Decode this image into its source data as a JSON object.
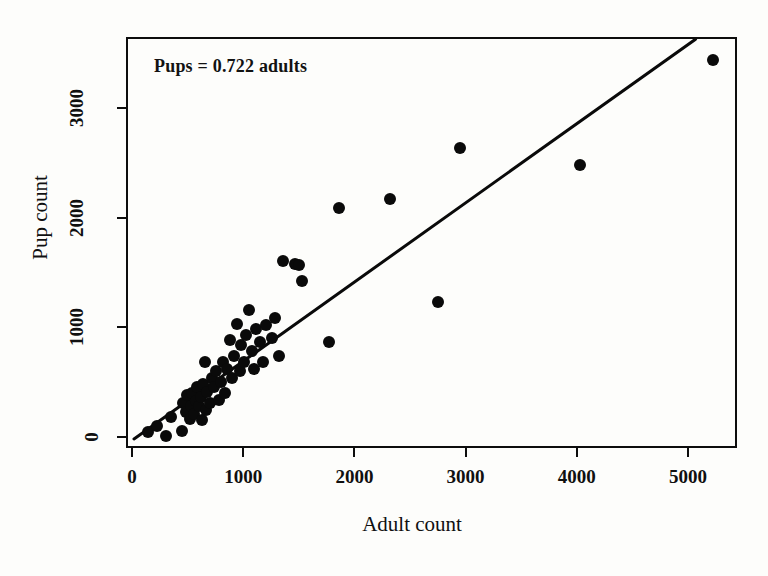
{
  "figure": {
    "background_color": "#fdfdfb",
    "foreground_color": "#0a0a0a"
  },
  "annotation": {
    "equation_text": "Pups = 0.722 adults"
  },
  "axis_titles": {
    "x": "Adult count",
    "y": "Pup count"
  },
  "chart_data": {
    "type": "scatter",
    "title": "",
    "subtitle": "",
    "xlabel": "Adult count",
    "ylabel": "Pup count",
    "xlim": [
      -50,
      5450
    ],
    "ylim": [
      -100,
      3600
    ],
    "xticks": [
      0,
      1000,
      2000,
      3000,
      4000,
      5000
    ],
    "yticks": [
      0,
      1000,
      2000,
      3000
    ],
    "xticklabels": [
      "0",
      "1000",
      "2000",
      "3000",
      "4000",
      "5000"
    ],
    "yticklabels": [
      "0",
      "1000",
      "2000",
      "3000"
    ],
    "grid": false,
    "legend": false,
    "legend_position": "none",
    "annotations": [
      {
        "text": "Pups = 0.722 adults",
        "x": 250,
        "y": 3380
      }
    ],
    "marker": {
      "style": "circle",
      "filled": true,
      "color": "#0a0a0a",
      "size_px": 12
    },
    "fit_line": {
      "type": "linear-through-origin",
      "slope": 0.722,
      "intercept": 0,
      "color": "#0a0a0a",
      "width_px": 3,
      "x_start": 0,
      "y_start": 0,
      "x_end": 5050,
      "y_end": 3646,
      "equation": "Pups = 0.722 adults"
    },
    "series": [
      {
        "name": "Colony counts",
        "points": [
          [
            130,
            60
          ],
          [
            210,
            120
          ],
          [
            290,
            30
          ],
          [
            330,
            200
          ],
          [
            430,
            70
          ],
          [
            440,
            330
          ],
          [
            470,
            250
          ],
          [
            480,
            400
          ],
          [
            500,
            180
          ],
          [
            510,
            300
          ],
          [
            520,
            420
          ],
          [
            540,
            230
          ],
          [
            560,
            350
          ],
          [
            570,
            470
          ],
          [
            585,
            300
          ],
          [
            600,
            380
          ],
          [
            610,
            170
          ],
          [
            620,
            500
          ],
          [
            640,
            700
          ],
          [
            650,
            260
          ],
          [
            660,
            430
          ],
          [
            680,
            330
          ],
          [
            700,
            560
          ],
          [
            720,
            470
          ],
          [
            740,
            620
          ],
          [
            760,
            360
          ],
          [
            780,
            520
          ],
          [
            800,
            700
          ],
          [
            820,
            420
          ],
          [
            840,
            640
          ],
          [
            860,
            900
          ],
          [
            880,
            560
          ],
          [
            900,
            760
          ],
          [
            930,
            1050
          ],
          [
            950,
            620
          ],
          [
            960,
            860
          ],
          [
            990,
            700
          ],
          [
            1010,
            950
          ],
          [
            1030,
            1180
          ],
          [
            1060,
            800
          ],
          [
            1080,
            640
          ],
          [
            1100,
            1000
          ],
          [
            1130,
            880
          ],
          [
            1160,
            700
          ],
          [
            1190,
            1040
          ],
          [
            1240,
            920
          ],
          [
            1270,
            1100
          ],
          [
            1300,
            760
          ],
          [
            1340,
            1620
          ],
          [
            1450,
            1600
          ],
          [
            1480,
            1590
          ],
          [
            1510,
            1440
          ],
          [
            1755,
            880
          ],
          [
            1840,
            2110
          ],
          [
            2300,
            2190
          ],
          [
            2735,
            1250
          ],
          [
            2930,
            2650
          ],
          [
            4010,
            2500
          ],
          [
            5210,
            3460
          ]
        ]
      }
    ]
  }
}
